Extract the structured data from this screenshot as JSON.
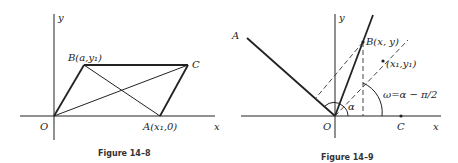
{
  "figures": [
    {
      "caption": "Figure 14–8",
      "labels": {
        "y_axis": "y",
        "x_axis": "x",
        "origin": "O",
        "point_b": "B(a,y₁)",
        "point_c": "C",
        "point_a": "A(x₁,0)"
      }
    },
    {
      "caption": "Figure 14–9",
      "labels": {
        "y_axis": "y",
        "x_axis": "x",
        "origin": "O",
        "point_a": "A",
        "point_b": "B(x, y)",
        "point_x1y1": "(x₁,y₁)",
        "point_c": "C",
        "alpha": "α",
        "omega_eq": "ω=α − π/2"
      }
    }
  ]
}
